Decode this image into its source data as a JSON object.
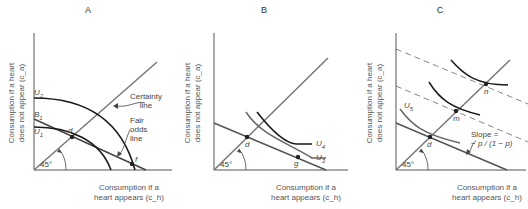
{
  "figure": {
    "panels": [
      {
        "id": "A",
        "title": "A",
        "y_axis_label_line1": "Consumption if a heart",
        "y_axis_label_line2": "does not appear (c_a)",
        "x_axis_label_line1": "Consumption if a",
        "x_axis_label_line2": "heart appears (c_h)",
        "angle_label": "45°",
        "curves": [
          "U2",
          "U1"
        ],
        "lines": [
          "Certainty line",
          "Fair odds line",
          "B1"
        ],
        "points": [
          "d",
          "f"
        ],
        "labels": {
          "u2": "U",
          "u2_sub": "2",
          "b1": "B",
          "b1_sub": "1",
          "u1": "U",
          "u1_sub": "1",
          "d": "d",
          "f": "f",
          "certainty_line1": "Certainty",
          "certainty_line2": "line",
          "fair_line1": "Fair",
          "fair_line2": "odds",
          "fair_line3": "line"
        }
      },
      {
        "id": "B",
        "title": "B",
        "y_axis_label_line1": "Consumption if a heart",
        "y_axis_label_line2": "does not appear (c_a)",
        "x_axis_label_line1": "Consumption if a",
        "x_axis_label_line2": "heart appears (c_h)",
        "angle_label": "45°",
        "curves": [
          "U4",
          "U3"
        ],
        "points": [
          "d",
          "g"
        ],
        "labels": {
          "u4": "U",
          "u4_sub": "4",
          "u3": "U",
          "u3_sub": "3",
          "d": "d",
          "g": "g"
        }
      },
      {
        "id": "C",
        "title": "C",
        "y_axis_label_line1": "Consumption if a heart",
        "y_axis_label_line2": "does not appear (c_a)",
        "x_axis_label_line1": "Consumption if a",
        "x_axis_label_line2": "heart appears (c_h)",
        "angle_label": "45°",
        "curves": [
          "U5"
        ],
        "points": [
          "d",
          "m",
          "n"
        ],
        "labels": {
          "u5": "U",
          "u5_sub": "5",
          "d": "d",
          "m": "m",
          "n": "n",
          "slope_line1": "Slope =",
          "slope_line2": "− p / (1 − p)"
        }
      }
    ],
    "colors": {
      "axis": "#444444",
      "curve_dark": "#1a1a1a",
      "line_gray": "#6b6b6b",
      "text": "#444444"
    }
  }
}
